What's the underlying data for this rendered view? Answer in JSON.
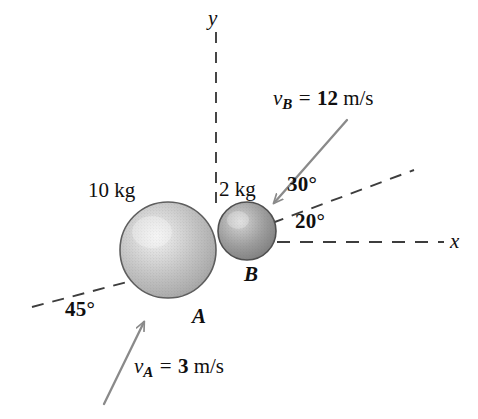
{
  "figure": {
    "background_color": "#ffffff",
    "ink_color": "#100f0f",
    "arrow_color": "#8a8a8a",
    "dash_color": "#4a4a4a",
    "width": 478,
    "height": 419
  },
  "axes": {
    "x_label": "x",
    "y_label": "y",
    "x_axis": {
      "style": "dashed",
      "y": 242,
      "x_start": 276,
      "x_end": 445
    },
    "y_axis": {
      "style": "dashed",
      "x": 216,
      "y_start": 32,
      "y_end": 208
    }
  },
  "bodies": [
    {
      "id": "A",
      "label": "A",
      "mass_label": "10 kg",
      "center_x": 168,
      "center_y": 250,
      "radius": 48,
      "shade": "light-gray"
    },
    {
      "id": "B",
      "label": "B",
      "mass_label": "2 kg",
      "center_x": 247,
      "center_y": 231,
      "radius": 29,
      "shade": "dark-gray"
    }
  ],
  "velocities": [
    {
      "id": "vA",
      "symbol": "v",
      "subscript": "A",
      "equals": "=",
      "magnitude": "3",
      "unit": "m/s",
      "text": "vA = 3 m/s",
      "angle_label": "45°",
      "direction": "up-and-to-the-right",
      "arrow_from_x": 104,
      "arrow_from_y": 403,
      "arrow_to_x": 146,
      "arrow_to_y": 318
    },
    {
      "id": "vB",
      "symbol": "v",
      "subscript": "B",
      "equals": "=",
      "magnitude": "12",
      "unit": "m/s",
      "text": "vB = 12 m/s",
      "angle_label": "30°",
      "direction": "down-and-to-the-left",
      "arrow_from_x": 347,
      "arrow_from_y": 120,
      "arrow_to_x": 270,
      "arrow_to_y": 207
    }
  ],
  "angles": [
    {
      "id": "angle-45",
      "label": "45°",
      "x": 68,
      "y": 305
    },
    {
      "id": "angle-30",
      "label": "30°",
      "x": 290,
      "y": 179
    },
    {
      "id": "angle-20",
      "label": "20°",
      "x": 298,
      "y": 216
    }
  ],
  "reference_lines": [
    {
      "id": "line-of-impact-left",
      "style": "dashed",
      "x1": 33,
      "y1": 306,
      "x2": 130,
      "y2": 282
    },
    {
      "id": "line-of-impact-right",
      "style": "dashed",
      "x1": 272,
      "y1": 223,
      "x2": 412,
      "y2": 171
    }
  ],
  "labels": {
    "mass_a": "10 kg",
    "mass_b": "2 kg",
    "body_a": "A",
    "body_b": "B",
    "axis_x": "x",
    "axis_y": "y"
  }
}
